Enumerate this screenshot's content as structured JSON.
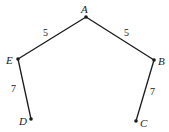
{
  "diagram": {
    "vertices": [
      {
        "id": "A",
        "label": "A",
        "x": 86,
        "y": 17,
        "lx": 81,
        "ly": 13
      },
      {
        "id": "B",
        "label": "B",
        "x": 154,
        "y": 60,
        "lx": 158,
        "ly": 65
      },
      {
        "id": "C",
        "label": "C",
        "x": 136,
        "y": 121,
        "lx": 140,
        "ly": 127
      },
      {
        "id": "D",
        "label": "D",
        "x": 31,
        "y": 119,
        "lx": 19,
        "ly": 125
      },
      {
        "id": "E",
        "label": "E",
        "x": 18,
        "y": 59,
        "lx": 6,
        "ly": 64
      }
    ],
    "edges": [
      {
        "from": "A",
        "to": "E",
        "weight": "5",
        "lx": 43,
        "ly": 36
      },
      {
        "from": "A",
        "to": "B",
        "weight": "5",
        "lx": 124,
        "ly": 36
      },
      {
        "from": "E",
        "to": "D",
        "weight": "7",
        "lx": 11,
        "ly": 92
      },
      {
        "from": "B",
        "to": "C",
        "weight": "7",
        "lx": 150,
        "ly": 95
      }
    ],
    "colors": {
      "ink": "#1a1a1a",
      "background": "#ffffff"
    }
  }
}
